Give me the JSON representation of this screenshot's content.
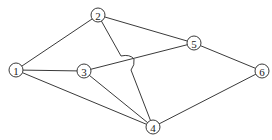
{
  "diagram": {
    "type": "undirected-graph",
    "node_radius": 7,
    "nodes": [
      {
        "id": "1",
        "label": "1",
        "x": 16,
        "y": 70
      },
      {
        "id": "2",
        "label": "2",
        "x": 98,
        "y": 15
      },
      {
        "id": "3",
        "label": "3",
        "x": 84,
        "y": 71
      },
      {
        "id": "4",
        "label": "4",
        "x": 153,
        "y": 127
      },
      {
        "id": "5",
        "label": "5",
        "x": 194,
        "y": 43
      },
      {
        "id": "6",
        "label": "6",
        "x": 262,
        "y": 71
      }
    ],
    "edges": [
      {
        "from": "1",
        "to": "2"
      },
      {
        "from": "1",
        "to": "3"
      },
      {
        "from": "1",
        "to": "4"
      },
      {
        "from": "2",
        "to": "5"
      },
      {
        "from": "2",
        "to": "4",
        "hop_over": "3-5"
      },
      {
        "from": "3",
        "to": "5"
      },
      {
        "from": "3",
        "to": "4"
      },
      {
        "from": "5",
        "to": "6"
      },
      {
        "from": "4",
        "to": "6"
      }
    ],
    "colors": {
      "stroke": "#3a3a3a",
      "node_fill": "#ffffff",
      "text": "#222222"
    }
  }
}
